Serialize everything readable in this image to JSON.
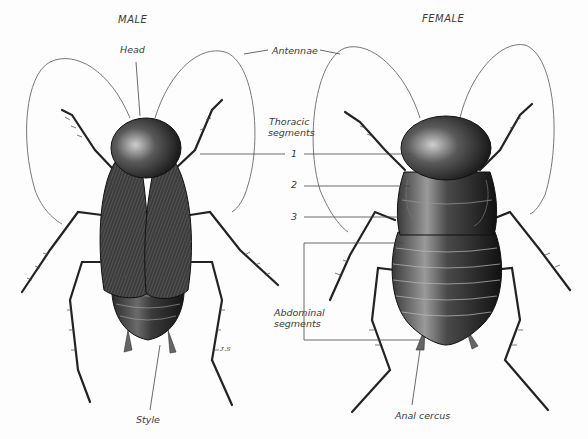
{
  "figure": {
    "panels": [
      {
        "title": "MALE"
      },
      {
        "title": "FEMALE"
      }
    ],
    "labels": {
      "head": "Head",
      "antennae": "Antennae",
      "thoracic_segments_line1": "Thoracic",
      "thoracic_segments_line2": "segments",
      "segment_1": "1",
      "segment_2": "2",
      "segment_3": "3",
      "abdominal_segments_line1": "Abdominal",
      "abdominal_segments_line2": "segments",
      "style": "Style",
      "anal_cercus": "Anal cercus"
    },
    "signature": "ᴊ.ꜱ",
    "colors": {
      "ink": "#1a1a1a",
      "label_text": "#3a3a3a",
      "leader_line": "#444444",
      "background": "#fdfdfd"
    }
  }
}
